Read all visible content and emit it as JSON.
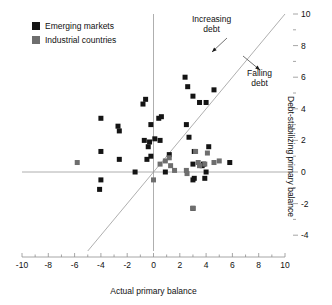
{
  "chart_data": {
    "type": "scatter",
    "title": "",
    "xlabel": "Actual primary balance",
    "ylabel": "Debt-stabilizing primary balance",
    "xlim": [
      -10,
      10
    ],
    "ylim": [
      -5,
      10
    ],
    "xticks": [
      -10,
      -8,
      -6,
      -4,
      -2,
      0,
      2,
      4,
      6,
      8,
      10
    ],
    "xtick_labels": [
      "-10",
      "-8",
      "-6",
      "-4",
      "-2",
      "0",
      "2",
      "4",
      "6",
      "8",
      "10"
    ],
    "xminor_ticks": [
      -9,
      -7,
      -5,
      -3,
      -1,
      1,
      3,
      5,
      7,
      9
    ],
    "yticks": [
      -4,
      -2,
      0,
      2,
      4,
      6,
      8,
      10
    ],
    "ytick_labels": [
      "-4",
      "-2",
      "0",
      "2",
      "4",
      "6",
      "8",
      "10"
    ],
    "yminor_ticks": [
      -3,
      -1,
      1,
      3,
      5,
      7,
      9
    ],
    "grid": false,
    "y_axis_position": "right",
    "legend_position": "top-left",
    "reference_lines": [
      {
        "name": "x-zero-line",
        "type": "vertical",
        "value": 0,
        "color": "#9a9a9a"
      },
      {
        "name": "y-zero-line",
        "type": "horizontal",
        "value": 0,
        "color": "#9a9a9a"
      },
      {
        "name": "forty-five-degree-line",
        "type": "identity",
        "from": [
          -5,
          -5
        ],
        "to": [
          10,
          10
        ],
        "color": "#9a9a9a"
      }
    ],
    "annotations": [
      {
        "name": "increasing-debt",
        "text_line1": "Increasing",
        "text_line2": "debt",
        "x": 3.2,
        "y": 9.0
      },
      {
        "name": "falling-debt",
        "text_line1": "Falling",
        "text_line2": "debt",
        "x": 7.1,
        "y": 5.5
      }
    ],
    "series": [
      {
        "name": "Emerging markets",
        "color": "#141414",
        "marker": "square",
        "points": [
          [
            -4.0,
            3.4
          ],
          [
            -4.0,
            1.3
          ],
          [
            -4.0,
            -0.5
          ],
          [
            -4.1,
            -1.1
          ],
          [
            -2.6,
            0.8
          ],
          [
            -2.6,
            2.6
          ],
          [
            -2.7,
            2.9
          ],
          [
            -1.4,
            0.0
          ],
          [
            -0.8,
            4.3
          ],
          [
            -0.6,
            4.6
          ],
          [
            -0.7,
            2.0
          ],
          [
            -0.5,
            0.8
          ],
          [
            -0.4,
            1.6
          ],
          [
            -0.3,
            1.9
          ],
          [
            -0.2,
            3.0
          ],
          [
            -0.2,
            1.0
          ],
          [
            0.1,
            2.1
          ],
          [
            0.4,
            3.4
          ],
          [
            0.5,
            2.0
          ],
          [
            0.6,
            3.5
          ],
          [
            0.9,
            0.0
          ],
          [
            1.2,
            1.1
          ],
          [
            2.4,
            6.0
          ],
          [
            2.6,
            5.4
          ],
          [
            2.5,
            3.0
          ],
          [
            2.7,
            2.2
          ],
          [
            3.0,
            4.8
          ],
          [
            3.1,
            1.3
          ],
          [
            3.0,
            0.5
          ],
          [
            3.1,
            -0.4
          ],
          [
            3.0,
            -0.5
          ],
          [
            3.0,
            -2.3
          ],
          [
            3.5,
            4.4
          ],
          [
            3.7,
            0.4
          ],
          [
            3.8,
            0.5
          ],
          [
            3.9,
            -0.4
          ],
          [
            4.0,
            4.4
          ],
          [
            4.0,
            0.0
          ],
          [
            4.2,
            1.6
          ],
          [
            4.6,
            5.2
          ],
          [
            5.8,
            0.6
          ]
        ]
      },
      {
        "name": "Industrial countries",
        "color": "#6e6e6e",
        "marker": "square",
        "points": [
          [
            -5.8,
            0.6
          ],
          [
            0.0,
            -0.5
          ],
          [
            0.5,
            0.5
          ],
          [
            0.9,
            0.7
          ],
          [
            1.2,
            0.9
          ],
          [
            1.3,
            0.4
          ],
          [
            1.6,
            0.1
          ],
          [
            2.5,
            0.1
          ],
          [
            2.55,
            -0.1
          ],
          [
            3.2,
            1.3
          ],
          [
            3.4,
            0.6
          ],
          [
            3.5,
            0.4
          ],
          [
            3.9,
            0.5
          ],
          [
            4.1,
            1.2
          ],
          [
            4.6,
            0.6
          ],
          [
            5.0,
            0.7
          ],
          [
            3.0,
            -2.3
          ]
        ]
      }
    ]
  },
  "legend": {
    "items": [
      {
        "label": "Emerging markets",
        "color": "#141414"
      },
      {
        "label": "Industrial countries",
        "color": "#6e6e6e"
      }
    ]
  },
  "annotations": {
    "increasing_debt_line1": "Increasing",
    "increasing_debt_line2": "debt",
    "falling_debt_line1": "Falling",
    "falling_debt_line2": "debt"
  },
  "axes": {
    "x_title": "Actual primary balance",
    "y_title": "Debt-stabilizing primary balance"
  },
  "colors": {
    "emerging": "#141414",
    "industrial": "#6e6e6e",
    "axis": "#8f8f8f",
    "text": "#111111"
  }
}
